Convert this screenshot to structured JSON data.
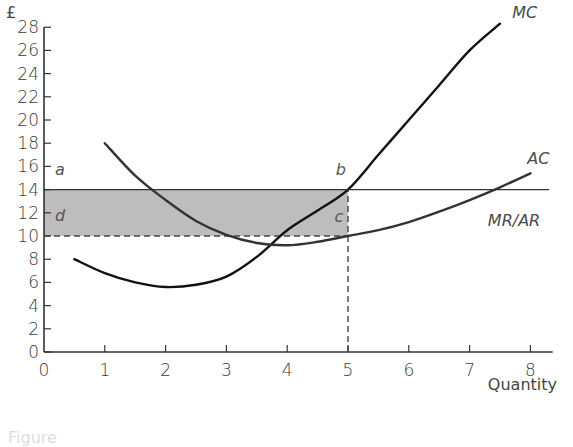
{
  "chart_data": {
    "type": "line",
    "title": "",
    "xlabel": "Quantity",
    "ylabel": "£",
    "xlim": [
      0,
      8.3
    ],
    "ylim": [
      0,
      28
    ],
    "x_ticks": [
      0,
      1,
      2,
      3,
      4,
      5,
      6,
      7,
      8
    ],
    "y_ticks": [
      0,
      2,
      4,
      6,
      8,
      10,
      12,
      14,
      16,
      18,
      20,
      22,
      24,
      26,
      28
    ],
    "grid": false,
    "legend": "inline curve labels",
    "series": [
      {
        "name": "MC",
        "color": "#111111",
        "points": [
          [
            0.5,
            8
          ],
          [
            1,
            6.8
          ],
          [
            1.5,
            6.0
          ],
          [
            2,
            5.6
          ],
          [
            2.5,
            5.8
          ],
          [
            3,
            6.5
          ],
          [
            3.5,
            8.2
          ],
          [
            4,
            10.5
          ],
          [
            4.5,
            12.2
          ],
          [
            5,
            14
          ],
          [
            5.5,
            17
          ],
          [
            6,
            20
          ],
          [
            6.5,
            23
          ],
          [
            7,
            26
          ],
          [
            7.5,
            28.3
          ]
        ],
        "label_pos": [
          7.7,
          28.8
        ]
      },
      {
        "name": "AC",
        "color": "#333333",
        "points": [
          [
            1,
            18
          ],
          [
            1.5,
            15.2
          ],
          [
            2,
            13.1
          ],
          [
            2.5,
            11.3
          ],
          [
            3,
            10.1
          ],
          [
            3.5,
            9.4
          ],
          [
            4,
            9.2
          ],
          [
            4.5,
            9.5
          ],
          [
            5,
            10
          ],
          [
            5.5,
            10.5
          ],
          [
            6,
            11.2
          ],
          [
            6.5,
            12.1
          ],
          [
            7,
            13.1
          ],
          [
            7.5,
            14.2
          ],
          [
            8,
            15.4
          ]
        ],
        "label_pos": [
          7.95,
          16.2
        ]
      },
      {
        "name": "MR/AR",
        "color": "#333333",
        "points": [
          [
            0,
            14
          ],
          [
            8.3,
            14
          ]
        ],
        "label_pos": [
          7.3,
          10.9
        ]
      }
    ],
    "annotations": {
      "shaded_area": {
        "x": [
          0,
          5
        ],
        "y": [
          10,
          14
        ],
        "color": "#bdbdbd",
        "meaning": "supernormal profit"
      },
      "dashed_lines": [
        {
          "from": [
            0,
            10
          ],
          "to": [
            5,
            10
          ]
        },
        {
          "from": [
            5,
            0
          ],
          "to": [
            5,
            14
          ]
        }
      ],
      "points": [
        {
          "label": "a",
          "x": 0,
          "y": 14,
          "pos": [
            0.18,
            15.3
          ]
        },
        {
          "label": "b",
          "x": 5,
          "y": 14,
          "pos": [
            4.8,
            15.3
          ]
        },
        {
          "label": "c",
          "x": 5,
          "y": 10,
          "pos": [
            4.78,
            11.2
          ]
        },
        {
          "label": "d",
          "x": 0,
          "y": 10,
          "pos": [
            0.18,
            11.3
          ]
        }
      ]
    }
  },
  "caption": "Figure"
}
